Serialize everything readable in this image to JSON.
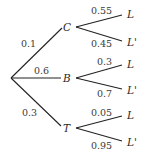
{
  "diagram": {
    "type": "probability-tree",
    "root": {
      "x": 11,
      "y": 78
    },
    "first_level": [
      {
        "label": "C",
        "probability": "0.1",
        "node": {
          "x": 66,
          "y": 27
        },
        "prob_pos": {
          "x": 19,
          "y": 46
        },
        "branches": [
          {
            "label": "L",
            "probability": "0.55",
            "end": {
              "x": 123,
              "y": 14
            },
            "prob_pos": {
              "x": 91,
              "y": 13
            }
          },
          {
            "label": "L'",
            "probability": "0.45",
            "end": {
              "x": 123,
              "y": 42
            },
            "prob_pos": {
              "x": 91,
              "y": 47
            }
          }
        ]
      },
      {
        "label": "B",
        "probability": "0.6",
        "node": {
          "x": 66,
          "y": 78
        },
        "prob_pos": {
          "x": 35,
          "y": 73
        },
        "branches": [
          {
            "label": "L",
            "probability": "0.3",
            "end": {
              "x": 123,
              "y": 64
            },
            "prob_pos": {
              "x": 97,
              "y": 64
            }
          },
          {
            "label": "L'",
            "probability": "0.7",
            "end": {
              "x": 123,
              "y": 90
            },
            "prob_pos": {
              "x": 97,
              "y": 97
            }
          }
        ]
      },
      {
        "label": "T",
        "probability": "0.3",
        "node": {
          "x": 66,
          "y": 128
        },
        "prob_pos": {
          "x": 22,
          "y": 115
        },
        "branches": [
          {
            "label": "L",
            "probability": "0.05",
            "end": {
              "x": 123,
              "y": 115
            },
            "prob_pos": {
              "x": 91,
              "y": 115
            }
          },
          {
            "label": "L'",
            "probability": "0.95",
            "end": {
              "x": 123,
              "y": 142
            },
            "prob_pos": {
              "x": 91,
              "y": 149
            }
          }
        ]
      }
    ]
  }
}
